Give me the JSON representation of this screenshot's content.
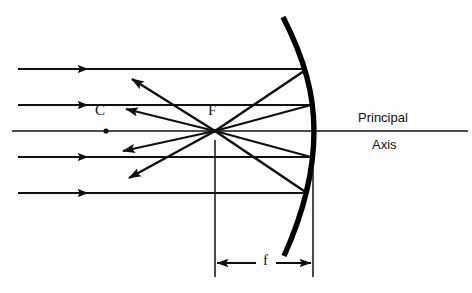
{
  "diagram": {
    "background_color": "#fdfdfd",
    "ink_color": "#111111",
    "mirror_color": "#000000",
    "labels": {
      "center_of_curvature": "C",
      "focal_point": "F",
      "focal_length": "f",
      "axis_line_1": "Principal",
      "axis_line_2": "Axis"
    },
    "geometry": {
      "focal_point": {
        "x": 215,
        "y": 131
      },
      "center_of_curvature_dot": {
        "x": 106,
        "y": 131
      },
      "mirror_vertex": {
        "x": 314,
        "y": 131
      },
      "principal_axis_y": 131,
      "principal_axis_x_start": 12,
      "principal_axis_x_end": 468,
      "focal_length_px": 99
    },
    "incident_rays": [
      {
        "name": "incident-ray-top",
        "y": 69,
        "x_start": 18,
        "x_end": 307,
        "arrow_x": 85
      },
      {
        "name": "incident-ray-upper",
        "y": 105,
        "x_start": 18,
        "x_end": 311,
        "arrow_x": 85
      },
      {
        "name": "incident-ray-lower",
        "y": 157,
        "x_start": 18,
        "x_end": 311,
        "arrow_x": 85
      },
      {
        "name": "incident-ray-bottom",
        "y": 193,
        "x_start": 18,
        "x_end": 307,
        "arrow_x": 85
      }
    ],
    "reflected_rays_to_focus": [
      {
        "name": "reflected-ray-top-to-focus",
        "from_x": 307,
        "from_y": 69,
        "to_x": 215,
        "to_y": 131
      },
      {
        "name": "reflected-ray-upper-to-focus",
        "from_x": 311,
        "from_y": 105,
        "to_x": 215,
        "to_y": 131
      },
      {
        "name": "reflected-ray-lower-to-focus",
        "from_x": 311,
        "from_y": 157,
        "to_x": 215,
        "to_y": 131
      },
      {
        "name": "reflected-ray-bottom-to-focus",
        "from_x": 307,
        "from_y": 193,
        "to_x": 215,
        "to_y": 131
      }
    ],
    "diverging_rays_from_focus": [
      {
        "name": "diverging-ray-upper-steep",
        "from_x": 215,
        "from_y": 131,
        "to_x": 130,
        "to_y": 77
      },
      {
        "name": "diverging-ray-upper-shallow",
        "from_x": 215,
        "from_y": 131,
        "to_x": 124,
        "to_y": 108
      },
      {
        "name": "diverging-ray-lower-shallow",
        "from_x": 215,
        "from_y": 131,
        "to_x": 121,
        "to_y": 152
      },
      {
        "name": "diverging-ray-lower-steep",
        "from_x": 215,
        "from_y": 131,
        "to_x": 127,
        "to_y": 180
      }
    ],
    "mirror": {
      "name": "concave-mirror-arc",
      "top_point": {
        "x": 283,
        "y": 17
      },
      "bottom_point": {
        "x": 284,
        "y": 256
      },
      "vertex": {
        "x": 314,
        "y": 131
      },
      "stroke_width": 5
    },
    "focal_length_dimension": {
      "name": "focal-length-dimension",
      "y": 263,
      "x_left": 215,
      "x_right": 313,
      "left_extension_top": 140,
      "left_extension_bottom": 277,
      "right_extension_top": 165,
      "right_extension_bottom": 277
    }
  }
}
